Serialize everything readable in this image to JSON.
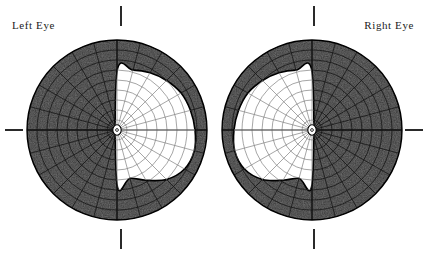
{
  "page": {
    "background_color": "#ffffff",
    "width": 428,
    "height": 255
  },
  "labels": {
    "left_eye": "Left Eye",
    "right_eye": "Right Eye"
  },
  "colors": {
    "ink": "#1b1b1b",
    "blind_field": "#3a3a3a",
    "seeing_field": "#ffffff",
    "grid_line": "#111111",
    "grid_line_light": "#808080",
    "outline": "#000000",
    "tick": "#2a2a2a"
  },
  "ticks": [
    {
      "name": "tick-top-left",
      "orientation": "vertical"
    },
    {
      "name": "tick-top-right",
      "orientation": "vertical"
    },
    {
      "name": "tick-bottom-left",
      "orientation": "vertical"
    },
    {
      "name": "tick-bottom-right",
      "orientation": "vertical"
    },
    {
      "name": "tick-left",
      "orientation": "horizontal"
    },
    {
      "name": "tick-right",
      "orientation": "horizontal"
    }
  ],
  "chart_data": {
    "type": "scatter",
    "xlabel": "",
    "ylabel": "",
    "legend": [],
    "grid": true,
    "projection": "polar",
    "radial_ticks": [
      10,
      20,
      30,
      40,
      50,
      60,
      70,
      80,
      90
    ],
    "meridian_step_degrees": 15,
    "charts": [
      {
        "name": "left-eye-field",
        "eye": "Left Eye",
        "center": [
          117,
          130
        ],
        "radius": 90,
        "seeing_side": "right",
        "blind_side": "left",
        "interpretation": "left homonymous field loss; nasal/temporal island preserved on the right half",
        "seeing_region_polar": [
          {
            "angle": 90,
            "radius": 58
          },
          {
            "angle": 75,
            "radius": 62
          },
          {
            "angle": 60,
            "radius": 66
          },
          {
            "angle": 45,
            "radius": 70
          },
          {
            "angle": 30,
            "radius": 74
          },
          {
            "angle": 15,
            "radius": 76
          },
          {
            "angle": 0,
            "radius": 78
          },
          {
            "angle": -15,
            "radius": 80
          },
          {
            "angle": -30,
            "radius": 78
          },
          {
            "angle": -45,
            "radius": 70
          },
          {
            "angle": -60,
            "radius": 58
          },
          {
            "angle": -75,
            "radius": 50
          },
          {
            "angle": -90,
            "radius": 54
          }
        ]
      },
      {
        "name": "right-eye-field",
        "eye": "Right Eye",
        "center": [
          312,
          130
        ],
        "radius": 90,
        "seeing_side": "left",
        "blind_side": "right",
        "interpretation": "right homonymous field loss; island preserved on the left half",
        "seeing_region_polar": [
          {
            "angle": 90,
            "radius": 58
          },
          {
            "angle": 105,
            "radius": 62
          },
          {
            "angle": 120,
            "radius": 66
          },
          {
            "angle": 135,
            "radius": 70
          },
          {
            "angle": 150,
            "radius": 74
          },
          {
            "angle": 165,
            "radius": 76
          },
          {
            "angle": 180,
            "radius": 78
          },
          {
            "angle": 195,
            "radius": 80
          },
          {
            "angle": 210,
            "radius": 78
          },
          {
            "angle": 225,
            "radius": 70
          },
          {
            "angle": 240,
            "radius": 58
          },
          {
            "angle": 255,
            "radius": 50
          },
          {
            "angle": 270,
            "radius": 54
          }
        ]
      }
    ]
  }
}
